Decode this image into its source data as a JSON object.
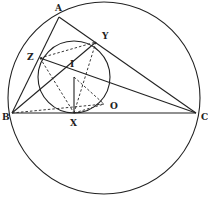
{
  "diagram": {
    "title": "",
    "colors": {
      "stroke": "#222222",
      "background": "#ffffff"
    },
    "points": {
      "A": {
        "label": "A",
        "x": 59,
        "y": 17
      },
      "B": {
        "label": "B",
        "x": 12,
        "y": 113
      },
      "C": {
        "label": "C",
        "x": 196,
        "y": 113
      },
      "Z": {
        "label": "Z",
        "x": 40,
        "y": 58
      },
      "Y": {
        "label": "Y",
        "x": 96,
        "y": 42
      },
      "I": {
        "label": "I",
        "x": 74,
        "y": 77
      },
      "X": {
        "label": "X",
        "x": 74,
        "y": 113
      },
      "O": {
        "label": "O",
        "x": 104,
        "y": 98
      },
      "P": {
        "label": "",
        "x": 104,
        "y": 104
      }
    },
    "circles": [
      {
        "name": "circumcircle",
        "cx": 104,
        "cy": 98,
        "r": 96
      },
      {
        "name": "incircle",
        "cx": 74,
        "cy": 77,
        "r": 36
      }
    ],
    "solid_segments": [
      [
        "A",
        "B"
      ],
      [
        "A",
        "C"
      ],
      [
        "B",
        "C"
      ],
      [
        "B",
        "Y"
      ],
      [
        "C",
        "Z"
      ],
      [
        "I",
        "X"
      ]
    ],
    "dashed_segments": [
      [
        "Z",
        "Y"
      ],
      [
        "Z",
        "X"
      ],
      [
        "Y",
        "X"
      ],
      [
        "B",
        "P"
      ],
      [
        "X",
        "P"
      ],
      [
        "I",
        "P"
      ]
    ]
  }
}
